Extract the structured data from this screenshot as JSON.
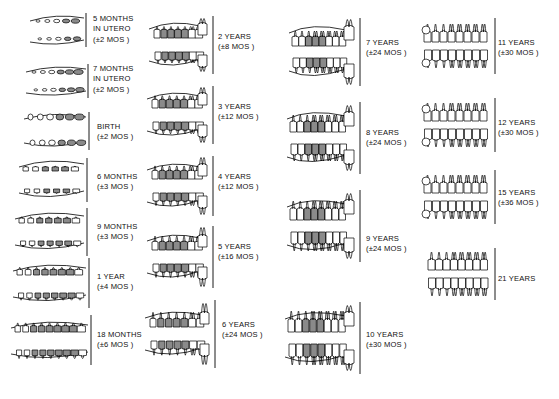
{
  "chart": {
    "type": "diagram",
    "columns": 4,
    "total_stages": 22,
    "legend": {
      "shaded_fill": "#8a8a8a",
      "outline": "#000000",
      "background": "#ffffff"
    }
  },
  "columns": [
    {
      "id": "column-1",
      "stages": [
        {
          "id": "stage-5-months-in-utero",
          "lines": [
            "5 MONTHS",
            "IN UTERO",
            "(±2 MOS )"
          ],
          "age": "5 months in utero",
          "tolerance": "±2 mos"
        },
        {
          "id": "stage-7-months-in-utero",
          "lines": [
            "7 MONTHS",
            "IN UTERO",
            "(±2 MOS )"
          ],
          "age": "7 months in utero",
          "tolerance": "±2 mos"
        },
        {
          "id": "stage-birth",
          "lines": [
            "BIRTH",
            "(±2 MOS )"
          ],
          "age": "birth",
          "tolerance": "±2 mos"
        },
        {
          "id": "stage-6-months",
          "lines": [
            "6 MONTHS",
            "(±3 MOS )"
          ],
          "age": "6 months",
          "tolerance": "±3 mos"
        },
        {
          "id": "stage-9-months",
          "lines": [
            "9 MONTHS",
            "(±3 MOS )"
          ],
          "age": "9 months",
          "tolerance": "±3 mos"
        },
        {
          "id": "stage-1-year",
          "lines": [
            "1 YEAR",
            "(±4 MOS )"
          ],
          "age": "1 year",
          "tolerance": "±4 mos"
        },
        {
          "id": "stage-18-months",
          "lines": [
            "18 MONTHS",
            "(±6 MOS )"
          ],
          "age": "18 months",
          "tolerance": "±6 mos"
        }
      ]
    },
    {
      "id": "column-2",
      "stages": [
        {
          "id": "stage-2-years",
          "lines": [
            "2 YEARS",
            "(±8 MOS )"
          ],
          "age": "2 years",
          "tolerance": "±8 mos"
        },
        {
          "id": "stage-3-years",
          "lines": [
            "3 YEARS",
            "(±12 MOS )"
          ],
          "age": "3 years",
          "tolerance": "±12 mos"
        },
        {
          "id": "stage-4-years",
          "lines": [
            "4 YEARS",
            "(±12 MOS )"
          ],
          "age": "4 years",
          "tolerance": "±12 mos"
        },
        {
          "id": "stage-5-years",
          "lines": [
            "5 YEARS",
            "(±16 MOS )"
          ],
          "age": "5 years",
          "tolerance": "±16 mos"
        },
        {
          "id": "stage-6-years",
          "lines": [
            "6 YEARS",
            "(±24 MOS )"
          ],
          "age": "6 years",
          "tolerance": "±24 mos"
        }
      ]
    },
    {
      "id": "column-3",
      "stages": [
        {
          "id": "stage-7-years",
          "lines": [
            "7 YEARS",
            "(±24 MOS )"
          ],
          "age": "7 years",
          "tolerance": "±24 mos"
        },
        {
          "id": "stage-8-years",
          "lines": [
            "8 YEARS",
            "(±24 MOS )"
          ],
          "age": "8 years",
          "tolerance": "±24 mos"
        },
        {
          "id": "stage-9-years",
          "lines": [
            "9 YEARS",
            "(±24 MOS )"
          ],
          "age": "9 years",
          "tolerance": "±24 mos"
        },
        {
          "id": "stage-10-years",
          "lines": [
            "10 YEARS",
            "(±30 MOS )"
          ],
          "age": "10 years",
          "tolerance": "±30 mos"
        }
      ]
    },
    {
      "id": "column-4",
      "stages": [
        {
          "id": "stage-11-years",
          "lines": [
            "11 YEARS",
            "(±30 MOS )"
          ],
          "age": "11 years",
          "tolerance": "±30 mos"
        },
        {
          "id": "stage-12-years",
          "lines": [
            "12 YEARS",
            "(±30 MOS )"
          ],
          "age": "12 years",
          "tolerance": "±30 mos"
        },
        {
          "id": "stage-15-years",
          "lines": [
            "15 YEARS",
            "(±36 MOS )"
          ],
          "age": "15 years",
          "tolerance": "±36 mos"
        },
        {
          "id": "stage-21-years",
          "lines": [
            "21 YEARS"
          ],
          "age": "21 years",
          "tolerance": ""
        }
      ]
    }
  ]
}
